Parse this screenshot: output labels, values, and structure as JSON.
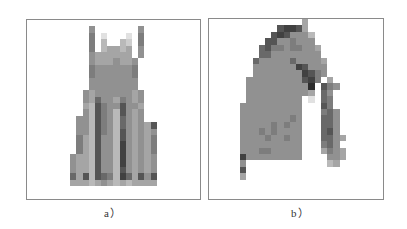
{
  "figure": {
    "panels": [
      {
        "id": "a",
        "caption": "a）",
        "subject": "dress",
        "grid_size": [
          28,
          28
        ],
        "rows": [
          "................................",
          "..........5.......5.........",
          "..........6.1...1.6.........",
          "..........6.3..32.6.........",
          "..........6.34434.5.........",
          "..........5444444.5.........",
          "..........54445445..........",
          "..........65555556..........",
          "..........65555556..........",
          "..........55555555..........",
          "..........55555555..........",
          ".........5455555545.........",
          ".........5475546545.........",
          ".........4386558554.........",
          ".........5386538545.........",
          "........55386537545.........",
          "........5538653754548.......",
          "........5538653854545.......",
          "........6438553854546.......",
          "........6438553954546.......",
          "........6438553954546.......",
          ".......54438553954545.......",
          ".......54438553954545.......",
          ".......54438553854545.......",
          ".......74838763974858.......",
          ".......44434543434444.......",
          "............................",
          "............................"
        ]
      },
      {
        "id": "b",
        "caption": "b）",
        "subject": "jacket",
        "grid_size": [
          28,
          28
        ],
        "rows": [
          "...............4............",
          "...........89984............",
          "..........8985553...........",
          ".........88556555...........",
          "........7866566554..........",
          "........7755555555..........",
          ".......755555755554.........",
          ".......555555598555.........",
          ".......555555559865.........",
          "......555555555896.4........",
          "......5555555555a.865.......",
          "......55555555554.75........",
          "......555555555.1.76........",
          ".....5555555555...86........",
          ".....5555555555...675.......",
          ".....5555555565...775.......",
          ".....5555565655...775.......",
          ".....5556565555...785.......",
          ".....5555655655...7754......",
          ".....5555555555...675.......",
          ".....5556655555...4654......",
          ".....9555555555....554......",
          ".....5.............34.......",
          ".....8......................",
          ".....4......................",
          "............................",
          "............................",
          "............................"
        ]
      }
    ]
  }
}
